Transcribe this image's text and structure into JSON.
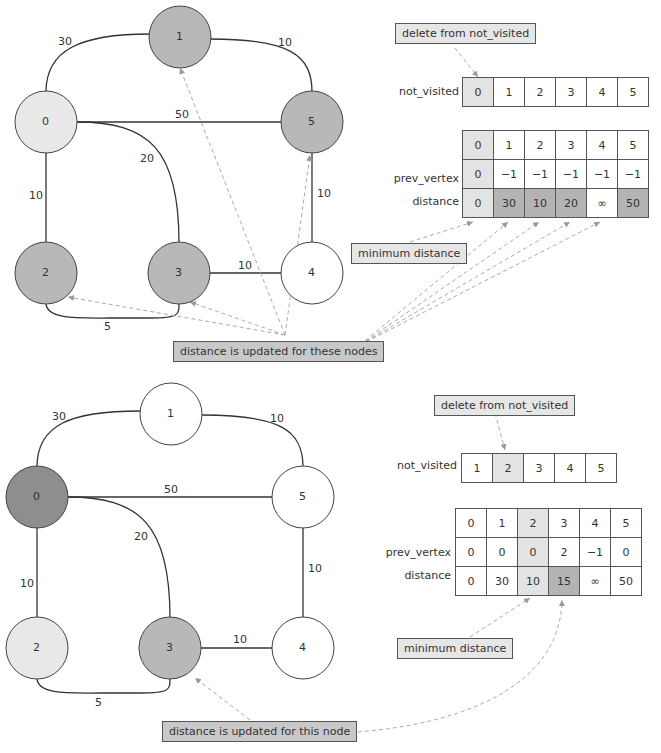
{
  "step1": {
    "graph": {
      "nodes": [
        {
          "id": "0",
          "fill": "#e8e8e8"
        },
        {
          "id": "1",
          "fill": "#b8b8b8"
        },
        {
          "id": "2",
          "fill": "#b8b8b8"
        },
        {
          "id": "3",
          "fill": "#b8b8b8"
        },
        {
          "id": "4",
          "fill": "#ffffff"
        },
        {
          "id": "5",
          "fill": "#b8b8b8"
        }
      ],
      "edges": [
        {
          "from": "0",
          "to": "1",
          "weight": "30"
        },
        {
          "from": "1",
          "to": "5",
          "weight": "10"
        },
        {
          "from": "0",
          "to": "5",
          "weight": "50"
        },
        {
          "from": "0",
          "to": "3",
          "weight": "20"
        },
        {
          "from": "0",
          "to": "2",
          "weight": "10"
        },
        {
          "from": "5",
          "to": "4",
          "weight": "10"
        },
        {
          "from": "3",
          "to": "4",
          "weight": "10"
        },
        {
          "from": "2",
          "to": "3",
          "weight": "5"
        }
      ]
    },
    "delete_note": "delete from not_visited",
    "not_visited_label": "not_visited",
    "not_visited": [
      "0",
      "1",
      "2",
      "3",
      "4",
      "5"
    ],
    "table": {
      "header": [
        "0",
        "1",
        "2",
        "3",
        "4",
        "5"
      ],
      "prev_vertex_label": "prev_vertex",
      "prev_vertex": [
        "0",
        "−1",
        "−1",
        "−1",
        "−1",
        "−1"
      ],
      "distance_label": "distance",
      "distance": [
        "0",
        "30",
        "10",
        "20",
        "∞",
        "50"
      ]
    },
    "min_note": "minimum distance",
    "update_note": "distance is updated for these nodes"
  },
  "step2": {
    "graph": {
      "nodes": [
        {
          "id": "0",
          "fill": "#8e8e8e"
        },
        {
          "id": "1",
          "fill": "#ffffff"
        },
        {
          "id": "2",
          "fill": "#e8e8e8"
        },
        {
          "id": "3",
          "fill": "#b8b8b8"
        },
        {
          "id": "4",
          "fill": "#ffffff"
        },
        {
          "id": "5",
          "fill": "#ffffff"
        }
      ]
    },
    "delete_note": "delete from not_visited",
    "not_visited_label": "not_visited",
    "not_visited": [
      "1",
      "2",
      "3",
      "4",
      "5"
    ],
    "table": {
      "header": [
        "0",
        "1",
        "2",
        "3",
        "4",
        "5"
      ],
      "prev_vertex_label": "prev_vertex",
      "prev_vertex": [
        "0",
        "0",
        "0",
        "2",
        "−1",
        "0"
      ],
      "distance_label": "distance",
      "distance": [
        "0",
        "30",
        "10",
        "15",
        "∞",
        "50"
      ]
    },
    "min_note": "minimum distance",
    "update_note": "distance is updated for this node"
  }
}
